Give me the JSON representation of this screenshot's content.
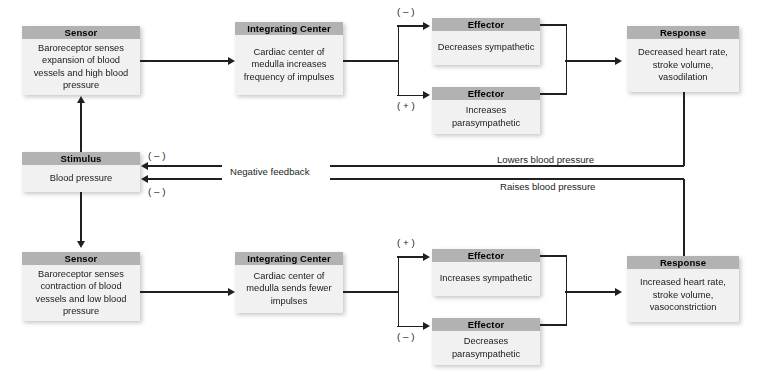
{
  "diagram": {
    "colors": {
      "header_fill": "#b2b2b2",
      "body_fill": "#f1f1f1",
      "line": "#231f20",
      "text": "#1a1a1a",
      "background": "#ffffff"
    }
  },
  "top_pathway": {
    "sensor": {
      "header": "Sensor",
      "body": "Baroreceptor senses expansion of blood vessels and high blood pressure"
    },
    "integrating_center": {
      "header": "Integrating Center",
      "body": "Cardiac center of medulla increases frequency of impulses"
    },
    "effector_1": {
      "header": "Effector",
      "body": "Decreases sympathetic",
      "sign": "( – )"
    },
    "effector_2": {
      "header": "Effector",
      "body": "Increases parasympathetic",
      "sign": "( + )"
    },
    "response": {
      "header": "Response",
      "body": "Decreased heart rate, stroke volume, vasodilation"
    },
    "feedback_label": "Lowers blood pressure",
    "stimulus_sign": "( – )"
  },
  "bottom_pathway": {
    "sensor": {
      "header": "Sensor",
      "body": "Baroreceptor senses contraction of blood vessels and low blood pressure"
    },
    "integrating_center": {
      "header": "Integrating Center",
      "body": "Cardiac center of medulla sends fewer impulses"
    },
    "effector_1": {
      "header": "Effector",
      "body": "Increases sympathetic",
      "sign": "( + )"
    },
    "effector_2": {
      "header": "Effector",
      "body": "Decreases parasympathetic",
      "sign": "( – )"
    },
    "response": {
      "header": "Response",
      "body": "Increased heart rate, stroke volume, vasoconstriction"
    },
    "feedback_label": "Raises blood pressure",
    "stimulus_sign": "( – )"
  },
  "stimulus": {
    "header": "Stimulus",
    "body": "Blood pressure"
  },
  "center_label": "Negative feedback"
}
